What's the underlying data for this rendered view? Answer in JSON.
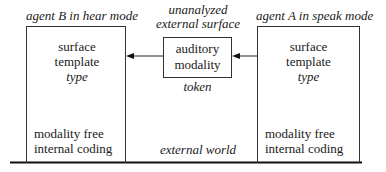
{
  "diagram": {
    "agent_b": {
      "title": "agent B in hear mode",
      "surface_line1": "surface",
      "surface_line2": "template",
      "type_label": "type",
      "coding_line1": "modality free",
      "coding_line2": "internal coding"
    },
    "middle": {
      "title_line1": "unanalyzed",
      "title_line2": "external surface",
      "box_line1": "auditory",
      "box_line2": "modality",
      "token_label": "token",
      "world_label": "external world"
    },
    "agent_a": {
      "title": "agent A in speak mode",
      "surface_line1": "surface",
      "surface_line2": "template",
      "type_label": "type",
      "coding_line1": "modality free",
      "coding_line2": "internal coding"
    },
    "arrows": [
      {
        "from": "agent-a-box",
        "to": "auditory-modality-box"
      },
      {
        "from": "auditory-modality-box",
        "to": "agent-b-box"
      }
    ]
  }
}
